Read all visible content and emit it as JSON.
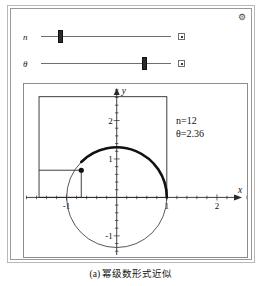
{
  "window": {
    "gear_icon": "gear-icon",
    "gear_glyph": "⚙"
  },
  "sliders": [
    {
      "name": "n",
      "label": "n",
      "value": 12,
      "min": 0,
      "max": 50,
      "fraction": 0.152,
      "end_box_icon": "slider-options-box"
    },
    {
      "name": "theta",
      "label": "θ",
      "value": 2.36,
      "min": 0,
      "max": 6.28,
      "fraction": 0.795,
      "end_box_icon": "slider-options-box"
    }
  ],
  "graph": {
    "annotations": [
      {
        "text": "n=12"
      },
      {
        "text": "θ=2.36"
      }
    ],
    "axis": {
      "x_label": "x",
      "y_label": "y",
      "x_ticks": [
        {
          "value": -1,
          "label": "-1"
        },
        {
          "value": 1,
          "label": "1"
        },
        {
          "value": 2,
          "label": "2"
        }
      ],
      "y_ticks": [
        {
          "value": -1,
          "label": "-1"
        },
        {
          "value": 1,
          "label": "1"
        },
        {
          "value": 2,
          "label": "2"
        }
      ],
      "xlim": [
        -1.85,
        2.6
      ],
      "ylim": [
        -1.55,
        2.95
      ]
    },
    "unit_circle": {
      "center": [
        0,
        0
      ],
      "radius": 1
    },
    "arc": {
      "start_angle_deg": 0,
      "end_angle_deg": 135,
      "radius": 1
    },
    "point": {
      "x": -0.707,
      "y": 0.707
    },
    "outer_rectangle": {
      "x1": -1.55,
      "y1": 0.0,
      "x2": 1.0,
      "y2": 2.62
    },
    "inner_rectangle": {
      "x1": -1.55,
      "y1": 0.0,
      "x2": -0.707,
      "y2": 0.707
    }
  },
  "caption": {
    "text": "(a) 幂级数形式近似"
  },
  "chart_data": {
    "type": "scatter",
    "title": "",
    "xlabel": "x",
    "ylabel": "y",
    "xlim": [
      -1.85,
      2.6
    ],
    "ylim": [
      -1.55,
      2.95
    ],
    "grid": false,
    "xticks": [
      -1,
      1,
      2
    ],
    "yticks": [
      -1,
      1,
      2
    ],
    "annotations": [
      "n=12",
      "θ=2.36"
    ],
    "series": [
      {
        "name": "unit-circle",
        "kind": "circle",
        "center": [
          0,
          0
        ],
        "radius": 1
      },
      {
        "name": "highlighted-arc",
        "kind": "arc",
        "radius": 1,
        "start_deg": 0,
        "end_deg": 135
      },
      {
        "name": "terminal-point",
        "kind": "point",
        "x": -0.707,
        "y": 0.707
      },
      {
        "name": "outer-rectangle",
        "kind": "rect",
        "x": [
          -1.55,
          1.0
        ],
        "y": [
          0.0,
          2.62
        ]
      },
      {
        "name": "inner-rectangle",
        "kind": "rect",
        "x": [
          -1.55,
          -0.707
        ],
        "y": [
          0.0,
          0.707
        ]
      }
    ]
  }
}
